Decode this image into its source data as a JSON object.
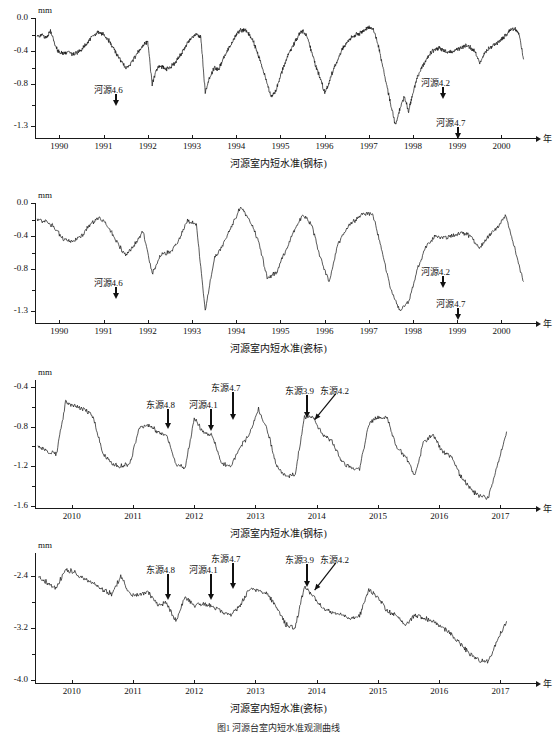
{
  "figure": {
    "caption": "图1  河源台室内短水准观测曲线"
  },
  "charts": [
    {
      "id": "chart-1",
      "caption": "河源室内短水准(钢标)",
      "unit": "mm",
      "xlabel": "年",
      "yticks": [
        "-1.3",
        "-0.8",
        "-0.4",
        "0.0"
      ],
      "ytick_values": [
        -1.3,
        -0.8,
        -0.4,
        0.0
      ],
      "xticks": [
        "1990",
        "1991",
        "1992",
        "1993",
        "1994",
        "1995",
        "1996",
        "1997",
        "1998",
        "1999",
        "2000"
      ],
      "ylim": [
        0.0,
        -1.45
      ],
      "xlim": [
        1989.45,
        2000.6
      ],
      "annotations": [
        {
          "label": "河源4.6",
          "x": 1991.25,
          "label_y": -0.92,
          "arrow_to_y": -0.63
        },
        {
          "label": "河源4.7",
          "x": 1999.0,
          "label_y": -1.32,
          "arrow_to_y": -0.82
        },
        {
          "label": "河源4.2",
          "x": 1998.65,
          "label_y": -0.83,
          "arrow_to_y": -0.5
        }
      ]
    },
    {
      "id": "chart-2",
      "caption": "河源室内短水准(瓷标)",
      "unit": "mm",
      "xlabel": "年",
      "yticks": [
        "-1.3",
        "-0.8",
        "-0.4",
        "0.0"
      ],
      "ytick_values": [
        -1.3,
        -0.8,
        -0.4,
        0.0
      ],
      "xticks": [
        "1990",
        "1991",
        "1992",
        "1993",
        "1994",
        "1995",
        "1996",
        "1997",
        "1998",
        "1999",
        "2000"
      ],
      "ylim": [
        0.0,
        -1.45
      ],
      "xlim": [
        1989.45,
        2000.6
      ],
      "annotations": [
        {
          "label": "河源4.6",
          "x": 1991.25,
          "label_y": -1.02,
          "arrow_to_y": -0.76
        },
        {
          "label": "河源4.7",
          "x": 1999.0,
          "label_y": -1.27,
          "arrow_to_y": -0.93
        },
        {
          "label": "河源4.2",
          "x": 1998.65,
          "label_y": -0.88,
          "arrow_to_y": -0.52
        }
      ]
    },
    {
      "id": "chart-3",
      "caption": "河源室内短水准(钢标)",
      "unit": "mm",
      "xlabel": "年",
      "yticks": [
        "-0.4",
        "-0.8",
        "-1.2",
        "-1.6"
      ],
      "ytick_values": [
        -0.4,
        -0.8,
        -1.2,
        -1.6
      ],
      "xticks": [
        "2010",
        "2011",
        "2012",
        "2013",
        "2014",
        "2015",
        "2016",
        "2017"
      ],
      "ylim": [
        -0.33,
        -1.62
      ],
      "xlim": [
        2009.4,
        2017.45
      ],
      "annotations": [
        {
          "label": "东源4.8",
          "x": 2011.55,
          "label_y": -0.62,
          "arrow_to_y": -0.82
        },
        {
          "label": "河源4.1",
          "x": 2012.25,
          "label_y": -0.62,
          "arrow_to_y": -0.84
        },
        {
          "label": "东源4.7",
          "x": 2012.62,
          "label_y": -0.45,
          "arrow_to_y": -0.73
        },
        {
          "label": "东源3.9",
          "x": 2013.82,
          "label_y": -0.48,
          "arrow_to_y": -0.71
        },
        {
          "label": "东源4.2",
          "x": 2013.95,
          "label_y": -0.48,
          "arrow_to_y": -0.73,
          "diagonal": true
        }
      ]
    },
    {
      "id": "chart-4",
      "caption": "河源室内短水准(瓷标)",
      "unit": "mm",
      "xlabel": "年",
      "yticks": [
        "-2.4",
        "-3.2",
        "-4.0"
      ],
      "ytick_values": [
        -2.4,
        -3.2,
        -4.0
      ],
      "xticks": [
        "2010",
        "2011",
        "2012",
        "2013",
        "2014",
        "2015",
        "2016",
        "2017"
      ],
      "ylim": [
        -2.05,
        -4.05
      ],
      "xlim": [
        2009.4,
        2017.45
      ],
      "annotations": [
        {
          "label": "东源4.8",
          "x": 2011.55,
          "label_y": -2.38,
          "arrow_to_y": -2.78
        },
        {
          "label": "河源4.1",
          "x": 2012.25,
          "label_y": -2.38,
          "arrow_to_y": -2.78
        },
        {
          "label": "东源4.7",
          "x": 2012.62,
          "label_y": -2.2,
          "arrow_to_y": -2.6
        },
        {
          "label": "东源3.9",
          "x": 2013.82,
          "label_y": -2.22,
          "arrow_to_y": -2.58
        },
        {
          "label": "东源4.2",
          "x": 2013.95,
          "label_y": -2.22,
          "arrow_to_y": -2.62,
          "diagonal": true
        }
      ]
    }
  ],
  "chart_data": [
    {
      "type": "line",
      "title": "河源室内短水准(钢标)",
      "xlabel": "年",
      "ylabel": "mm",
      "xlim": [
        1989.45,
        2000.6
      ],
      "ylim": [
        -1.45,
        0.0
      ],
      "grid": false,
      "legend": "none",
      "annotations": [
        "河源4.6",
        "河源4.7",
        "河源4.2"
      ],
      "series": [
        {
          "name": "河源室内短水准(钢标)",
          "x": [
            1989.5,
            1989.6,
            1989.7,
            1989.8,
            1989.9,
            1990.0,
            1990.1,
            1990.2,
            1990.3,
            1990.4,
            1990.5,
            1990.6,
            1990.7,
            1990.8,
            1990.9,
            1991.0,
            1991.1,
            1991.2,
            1991.3,
            1991.4,
            1991.5,
            1991.6,
            1991.7,
            1991.8,
            1991.9,
            1992.0,
            1992.1,
            1992.2,
            1992.3,
            1992.4,
            1992.5,
            1992.6,
            1992.7,
            1992.8,
            1992.9,
            1993.0,
            1993.1,
            1993.2,
            1993.3,
            1993.4,
            1993.5,
            1993.6,
            1993.7,
            1993.8,
            1993.9,
            1994.0,
            1994.1,
            1994.2,
            1994.3,
            1994.4,
            1994.5,
            1994.6,
            1994.7,
            1994.8,
            1994.9,
            1995.0,
            1995.1,
            1995.2,
            1995.3,
            1995.4,
            1995.5,
            1995.6,
            1995.7,
            1995.8,
            1995.9,
            1996.0,
            1996.1,
            1996.2,
            1996.3,
            1996.4,
            1996.5,
            1996.6,
            1996.7,
            1996.8,
            1996.9,
            1997.0,
            1997.1,
            1997.2,
            1997.3,
            1997.4,
            1997.5,
            1997.6,
            1997.7,
            1997.8,
            1997.9,
            1998.0,
            1998.1,
            1998.2,
            1998.3,
            1998.4,
            1998.5,
            1998.6,
            1998.7,
            1998.8,
            1998.9,
            1999.0,
            1999.1,
            1999.2,
            1999.3,
            1999.4,
            1999.5,
            1999.6,
            1999.7,
            1999.8,
            1999.9,
            2000.0,
            2000.1,
            2000.2,
            2000.3,
            2000.4,
            2000.5
          ],
          "y": [
            -0.22,
            -0.2,
            -0.24,
            -0.15,
            -0.32,
            -0.42,
            -0.43,
            -0.4,
            -0.44,
            -0.42,
            -0.38,
            -0.32,
            -0.25,
            -0.2,
            -0.17,
            -0.2,
            -0.26,
            -0.34,
            -0.44,
            -0.52,
            -0.6,
            -0.57,
            -0.48,
            -0.4,
            -0.33,
            -0.28,
            -0.8,
            -0.62,
            -0.58,
            -0.62,
            -0.6,
            -0.55,
            -0.48,
            -0.4,
            -0.3,
            -0.22,
            -0.2,
            -0.23,
            -0.9,
            -0.72,
            -0.6,
            -0.62,
            -0.5,
            -0.4,
            -0.3,
            -0.2,
            -0.15,
            -0.14,
            -0.2,
            -0.3,
            -0.45,
            -0.62,
            -0.8,
            -0.95,
            -0.88,
            -0.7,
            -0.55,
            -0.42,
            -0.32,
            -0.22,
            -0.16,
            -0.22,
            -0.4,
            -0.58,
            -0.72,
            -0.9,
            -0.78,
            -0.62,
            -0.5,
            -0.38,
            -0.3,
            -0.24,
            -0.2,
            -0.18,
            -0.15,
            -0.12,
            -0.14,
            -0.3,
            -0.55,
            -0.8,
            -1.05,
            -1.3,
            -1.1,
            -0.95,
            -1.12,
            -0.9,
            -0.72,
            -0.6,
            -0.5,
            -0.42,
            -0.38,
            -0.36,
            -0.4,
            -0.42,
            -0.4,
            -0.38,
            -0.36,
            -0.34,
            -0.36,
            -0.4,
            -0.55,
            -0.44,
            -0.38,
            -0.34,
            -0.3,
            -0.26,
            -0.2,
            -0.14,
            -0.12,
            -0.2,
            -0.5,
            -0.75,
            -0.9,
            -0.75,
            -0.5,
            -0.32
          ]
        }
      ]
    },
    {
      "type": "line",
      "title": "河源室内短水准(瓷标)",
      "xlabel": "年",
      "ylabel": "mm",
      "xlim": [
        1989.45,
        2000.6
      ],
      "ylim": [
        -1.45,
        0.0
      ],
      "grid": false,
      "legend": "none",
      "annotations": [
        "河源4.6",
        "河源4.7",
        "河源4.2"
      ],
      "series": [
        {
          "name": "河源室内短水准(瓷标)",
          "x": [
            1989.5,
            1989.7,
            1989.9,
            1990.1,
            1990.3,
            1990.5,
            1990.7,
            1990.9,
            1991.1,
            1991.3,
            1991.5,
            1991.7,
            1991.9,
            1992.1,
            1992.3,
            1992.5,
            1992.7,
            1992.9,
            1993.1,
            1993.3,
            1993.5,
            1993.7,
            1993.9,
            1994.1,
            1994.3,
            1994.5,
            1994.7,
            1994.9,
            1995.1,
            1995.3,
            1995.5,
            1995.7,
            1995.9,
            1996.1,
            1996.3,
            1996.5,
            1996.7,
            1996.9,
            1997.1,
            1997.3,
            1997.5,
            1997.7,
            1997.9,
            1998.1,
            1998.3,
            1998.5,
            1998.7,
            1998.9,
            1999.1,
            1999.3,
            1999.5,
            1999.7,
            1999.9,
            2000.1,
            2000.3,
            2000.5
          ],
          "y": [
            -0.2,
            -0.22,
            -0.3,
            -0.44,
            -0.46,
            -0.4,
            -0.25,
            -0.18,
            -0.28,
            -0.46,
            -0.64,
            -0.5,
            -0.34,
            -0.86,
            -0.62,
            -0.6,
            -0.45,
            -0.22,
            -0.25,
            -1.3,
            -0.68,
            -0.5,
            -0.28,
            -0.05,
            -0.2,
            -0.45,
            -0.9,
            -0.85,
            -0.6,
            -0.35,
            -0.14,
            -0.25,
            -0.65,
            -0.95,
            -0.5,
            -0.3,
            -0.2,
            -0.12,
            -0.15,
            -0.6,
            -1.05,
            -1.3,
            -1.2,
            -0.8,
            -0.52,
            -0.4,
            -0.42,
            -0.4,
            -0.36,
            -0.4,
            -0.55,
            -0.4,
            -0.3,
            -0.15,
            -0.55,
            -0.95
          ]
        }
      ]
    },
    {
      "type": "line",
      "title": "河源室内短水准(钢标)",
      "xlabel": "年",
      "ylabel": "mm",
      "xlim": [
        2009.4,
        2017.45
      ],
      "ylim": [
        -1.62,
        -0.33
      ],
      "grid": false,
      "legend": "none",
      "annotations": [
        "东源4.8",
        "河源4.1",
        "东源4.7",
        "东源3.9",
        "东源4.2"
      ],
      "series": [
        {
          "name": "河源室内短水准(钢标)",
          "x": [
            2009.45,
            2009.6,
            2009.75,
            2009.9,
            2010.05,
            2010.2,
            2010.35,
            2010.5,
            2010.65,
            2010.8,
            2010.95,
            2011.1,
            2011.25,
            2011.4,
            2011.55,
            2011.7,
            2011.85,
            2012.0,
            2012.15,
            2012.3,
            2012.45,
            2012.6,
            2012.75,
            2012.9,
            2013.05,
            2013.2,
            2013.35,
            2013.5,
            2013.65,
            2013.8,
            2013.95,
            2014.1,
            2014.25,
            2014.4,
            2014.55,
            2014.7,
            2014.85,
            2015.0,
            2015.15,
            2015.3,
            2015.45,
            2015.6,
            2015.75,
            2015.9,
            2016.05,
            2016.2,
            2016.35,
            2016.5,
            2016.65,
            2016.8,
            2016.95,
            2017.1
          ],
          "y": [
            -1.0,
            -1.05,
            -1.08,
            -0.55,
            -0.6,
            -0.62,
            -0.7,
            -1.05,
            -1.18,
            -1.2,
            -1.18,
            -0.82,
            -0.78,
            -0.85,
            -0.88,
            -1.18,
            -1.22,
            -0.72,
            -0.85,
            -0.9,
            -1.18,
            -1.2,
            -1.0,
            -0.88,
            -0.62,
            -0.85,
            -1.2,
            -1.3,
            -1.28,
            -0.7,
            -0.72,
            -0.88,
            -0.95,
            -1.15,
            -1.22,
            -1.22,
            -0.78,
            -0.7,
            -0.72,
            -1.0,
            -1.1,
            -1.3,
            -0.95,
            -0.88,
            -1.05,
            -1.1,
            -1.3,
            -1.42,
            -1.5,
            -1.52,
            -1.2,
            -0.85
          ]
        }
      ]
    },
    {
      "type": "line",
      "title": "河源室内短水准(瓷标)",
      "xlabel": "年",
      "ylabel": "mm",
      "xlim": [
        2009.4,
        2017.45
      ],
      "ylim": [
        -4.05,
        -2.05
      ],
      "grid": false,
      "legend": "none",
      "annotations": [
        "东源4.8",
        "河源4.1",
        "东源4.7",
        "东源3.9",
        "东源4.2"
      ],
      "series": [
        {
          "name": "河源室内短水准(瓷标)",
          "x": [
            2009.45,
            2009.6,
            2009.75,
            2009.9,
            2010.05,
            2010.2,
            2010.35,
            2010.5,
            2010.65,
            2010.8,
            2010.95,
            2011.1,
            2011.25,
            2011.4,
            2011.55,
            2011.7,
            2011.85,
            2012.0,
            2012.15,
            2012.3,
            2012.45,
            2012.6,
            2012.75,
            2012.9,
            2013.05,
            2013.2,
            2013.35,
            2013.5,
            2013.65,
            2013.8,
            2013.95,
            2014.1,
            2014.25,
            2014.4,
            2014.55,
            2014.7,
            2014.85,
            2015.0,
            2015.15,
            2015.3,
            2015.45,
            2015.6,
            2015.75,
            2015.9,
            2016.05,
            2016.2,
            2016.35,
            2016.5,
            2016.65,
            2016.8,
            2016.95,
            2017.1
          ],
          "y": [
            -2.4,
            -2.5,
            -2.58,
            -2.3,
            -2.35,
            -2.45,
            -2.52,
            -2.6,
            -2.68,
            -2.42,
            -2.68,
            -2.7,
            -2.65,
            -2.85,
            -2.82,
            -3.1,
            -2.72,
            -2.85,
            -2.82,
            -2.88,
            -2.95,
            -3.0,
            -2.85,
            -2.6,
            -2.62,
            -2.68,
            -2.9,
            -3.15,
            -3.2,
            -2.55,
            -2.72,
            -2.9,
            -2.98,
            -3.0,
            -3.05,
            -3.02,
            -2.62,
            -2.72,
            -2.95,
            -3.0,
            -3.18,
            -3.0,
            -3.05,
            -3.1,
            -3.2,
            -3.3,
            -3.45,
            -3.6,
            -3.7,
            -3.72,
            -3.4,
            -3.1
          ]
        }
      ]
    }
  ]
}
